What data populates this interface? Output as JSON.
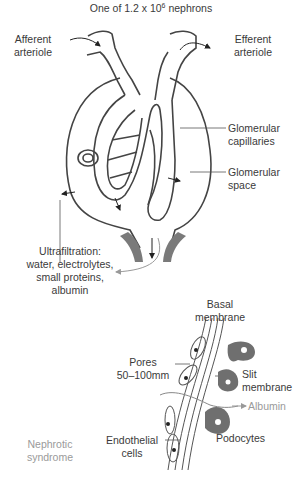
{
  "title": {
    "prefix": "One of 1.2 x 10",
    "exponent": "6",
    "suffix": " nephrons"
  },
  "labels": {
    "afferent_1": "Afferent",
    "afferent_2": "arteriole",
    "efferent_1": "Efferent",
    "efferent_2": "arteriole",
    "glom_cap_1": "Glomerular",
    "glom_cap_2": "capillaries",
    "glom_space_1": "Glomerular",
    "glom_space_2": "space",
    "ultra_1": "Ultrafiltration:",
    "ultra_2": "water, electrolytes,",
    "ultra_3": "small proteins,",
    "ultra_4": "albumin",
    "basal_1": "Basal",
    "basal_2": "membrane",
    "pores_1": "Pores",
    "pores_2": "50–100mm",
    "slit_1": "Slit",
    "slit_2": "membrane",
    "albumin": "Albumin",
    "podocytes": "Podocytes",
    "endo_1": "Endothelial",
    "endo_2": "cells",
    "nephrotic_1": "Nephrotic",
    "nephrotic_2": "syndrome"
  },
  "colors": {
    "line": "#444444",
    "podocyte_fill": "#6f6f6f",
    "stalk_fill": "#7a7a7a",
    "muted_text": "#9a9a9a"
  }
}
